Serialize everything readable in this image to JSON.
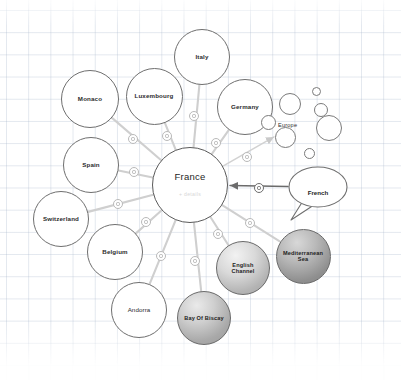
{
  "canvas": {
    "width": 401,
    "height": 380,
    "background_color": "#ffffff",
    "grid_color": "#aab9cd"
  },
  "graph": {
    "center_node": {
      "id": "france",
      "label": "France",
      "details_label": "+ details",
      "cx": 190,
      "cy": 185,
      "r": 38,
      "style": "plain",
      "border_color": "#5a5a5a"
    },
    "nodes": [
      {
        "id": "italy",
        "label": "Italy",
        "cx": 202,
        "cy": 57,
        "r": 28,
        "style": "plain",
        "label_class": "lbl-md"
      },
      {
        "id": "luxembourg",
        "label": "Luxembourg",
        "cx": 154,
        "cy": 96,
        "r": 28.5,
        "style": "plain",
        "label_class": "lbl-md"
      },
      {
        "id": "monaco",
        "label": "Monaco",
        "cx": 90,
        "cy": 99,
        "r": 29,
        "style": "plain",
        "label_class": "lbl-md"
      },
      {
        "id": "germany",
        "label": "Germany",
        "cx": 245,
        "cy": 107,
        "r": 28,
        "style": "plain",
        "label_class": "lbl-md"
      },
      {
        "id": "spain",
        "label": "Spain",
        "cx": 91,
        "cy": 165,
        "r": 28,
        "style": "plain",
        "label_class": "lbl-md"
      },
      {
        "id": "switzerland",
        "label": "Switzerland",
        "cx": 61,
        "cy": 219,
        "r": 28,
        "style": "plain",
        "label_class": "lbl-md"
      },
      {
        "id": "belgium",
        "label": "Belgium",
        "cx": 115,
        "cy": 252,
        "r": 28,
        "style": "plain",
        "label_class": "lbl-md"
      },
      {
        "id": "andorra",
        "label": "Andorra",
        "cx": 139,
        "cy": 310,
        "r": 28,
        "style": "plain",
        "label_class": "lbl-reg"
      },
      {
        "id": "english-channel",
        "label": "English Channel",
        "cx": 243,
        "cy": 268,
        "r": 27,
        "style": "sea light",
        "label_class": "lbl-sm"
      },
      {
        "id": "mediterranean-sea",
        "label": "Mediterranean Sea",
        "cx": 303,
        "cy": 256,
        "r": 27.5,
        "style": "sea dark",
        "label_class": "lbl-sm"
      },
      {
        "id": "bay-of-biscay",
        "label": "Bay Of Biscay",
        "cx": 204,
        "cy": 318,
        "r": 27,
        "style": "sea mid",
        "label_class": "lbl-sm"
      }
    ],
    "bubble_node": {
      "id": "french",
      "label": "French",
      "cx": 318,
      "cy": 187,
      "rx": 30,
      "ry": 21
    },
    "cluster": {
      "id": "europe",
      "label": "Europe",
      "label_x": 278,
      "label_y": 122,
      "circles": [
        {
          "cx": 290,
          "cy": 104,
          "r": 11
        },
        {
          "cx": 316,
          "cy": 91,
          "r": 4.5
        },
        {
          "cx": 321,
          "cy": 110,
          "r": 7
        },
        {
          "cx": 329,
          "cy": 128,
          "r": 13
        },
        {
          "cx": 285,
          "cy": 137,
          "r": 10.5
        },
        {
          "cx": 309,
          "cy": 153,
          "r": 5.5
        },
        {
          "cx": 268,
          "cy": 122,
          "r": 7.5
        }
      ]
    },
    "edges": [
      {
        "from": "france",
        "to": "italy",
        "badge_x": 194,
        "badge_y": 116,
        "badge_r": 5.2,
        "style": "faint"
      },
      {
        "from": "france",
        "to": "luxembourg",
        "badge_x": 167,
        "badge_y": 136,
        "badge_r": 5.2,
        "style": "faint"
      },
      {
        "from": "france",
        "to": "monaco",
        "badge_x": 133,
        "badge_y": 139,
        "badge_r": 5.2,
        "style": "faint"
      },
      {
        "from": "france",
        "to": "germany",
        "badge_x": 216,
        "badge_y": 143,
        "badge_r": 5.2,
        "style": "faint"
      },
      {
        "from": "france",
        "to": "spain",
        "badge_x": 134,
        "badge_y": 172,
        "badge_r": 5.2,
        "style": "faint"
      },
      {
        "from": "france",
        "to": "switzerland",
        "badge_x": 118,
        "badge_y": 204,
        "badge_r": 5.2,
        "style": "faint"
      },
      {
        "from": "france",
        "to": "belgium",
        "badge_x": 146,
        "badge_y": 222,
        "badge_r": 5.2,
        "style": "faint"
      },
      {
        "from": "france",
        "to": "andorra",
        "badge_x": 161,
        "badge_y": 256,
        "badge_r": 5.2,
        "style": "faint"
      },
      {
        "from": "france",
        "to": "bay-of-biscay",
        "badge_x": 195,
        "badge_y": 261,
        "badge_r": 5.2,
        "style": "faint"
      },
      {
        "from": "france",
        "to": "english-channel",
        "badge_x": 218,
        "badge_y": 234,
        "badge_r": 5.2,
        "style": "faint"
      },
      {
        "from": "france",
        "to": "mediterranean-sea",
        "badge_x": 250,
        "badge_y": 223,
        "badge_r": 5.2,
        "style": "faint"
      },
      {
        "from": "france",
        "to": "europe",
        "badge_x": 247,
        "badge_y": 157,
        "badge_r": 5.2,
        "style": "arrow-light"
      },
      {
        "from": "french",
        "to": "france",
        "badge_x": 259,
        "badge_y": 188,
        "badge_r": 5.2,
        "style": "arrow-strong"
      }
    ]
  }
}
